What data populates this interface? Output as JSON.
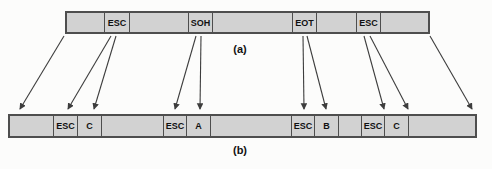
{
  "diagram": {
    "label_a": "(a)",
    "label_b": "(b)",
    "bar_a": {
      "cells": [
        {
          "label": ""
        },
        {
          "label": "ESC"
        },
        {
          "label": ""
        },
        {
          "label": "SOH"
        },
        {
          "label": ""
        },
        {
          "label": "EOT"
        },
        {
          "label": ""
        },
        {
          "label": "ESC"
        },
        {
          "label": ""
        }
      ]
    },
    "bar_b": {
      "cells": [
        {
          "label": ""
        },
        {
          "label": "ESC"
        },
        {
          "label": "C"
        },
        {
          "label": ""
        },
        {
          "label": "ESC"
        },
        {
          "label": "A"
        },
        {
          "label": ""
        },
        {
          "label": "ESC"
        },
        {
          "label": "B"
        },
        {
          "label": ""
        },
        {
          "label": "ESC"
        },
        {
          "label": "C"
        },
        {
          "label": ""
        }
      ]
    },
    "arrows": [
      {
        "x1": 64,
        "y1": 36,
        "x2": 20,
        "y2": 109
      },
      {
        "x1": 111,
        "y1": 36,
        "x2": 68,
        "y2": 109
      },
      {
        "x1": 116,
        "y1": 36,
        "x2": 94,
        "y2": 109
      },
      {
        "x1": 196,
        "y1": 36,
        "x2": 175,
        "y2": 109
      },
      {
        "x1": 201,
        "y1": 36,
        "x2": 200,
        "y2": 109
      },
      {
        "x1": 303,
        "y1": 36,
        "x2": 304,
        "y2": 109
      },
      {
        "x1": 307,
        "y1": 36,
        "x2": 326,
        "y2": 109
      },
      {
        "x1": 364,
        "y1": 36,
        "x2": 384,
        "y2": 109
      },
      {
        "x1": 370,
        "y1": 36,
        "x2": 408,
        "y2": 109
      },
      {
        "x1": 430,
        "y1": 36,
        "x2": 472,
        "y2": 109
      }
    ],
    "colors": {
      "cell_fill": "#d2d2d2",
      "border": "#4e4e4e",
      "arrow": "#3d3d3d",
      "background": "#fcfcfb"
    }
  }
}
